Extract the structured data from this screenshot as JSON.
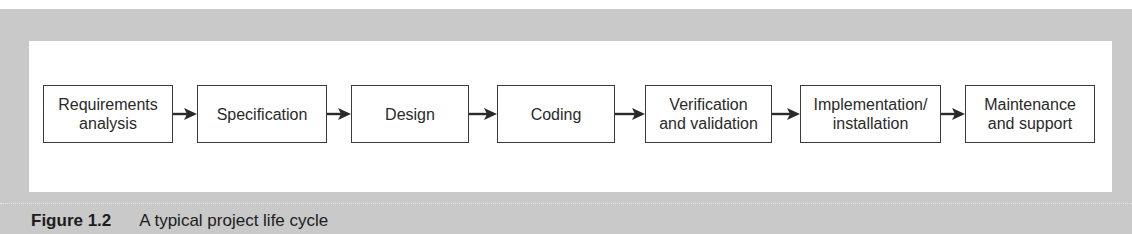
{
  "figure": {
    "caption_label": "Figure 1.2",
    "caption_text": "A typical project life cycle",
    "stages": [
      {
        "label": "Requirements\nanalysis"
      },
      {
        "label": "Specification"
      },
      {
        "label": "Design"
      },
      {
        "label": "Coding"
      },
      {
        "label": "Verification\nand validation"
      },
      {
        "label": "Implementation/\ninstallation"
      },
      {
        "label": "Maintenance\nand support"
      }
    ],
    "colors": {
      "panel_background": "#c9c9c9",
      "canvas_background": "#ffffff",
      "box_border": "#3a3a3a",
      "text": "#2a2a2a"
    }
  }
}
